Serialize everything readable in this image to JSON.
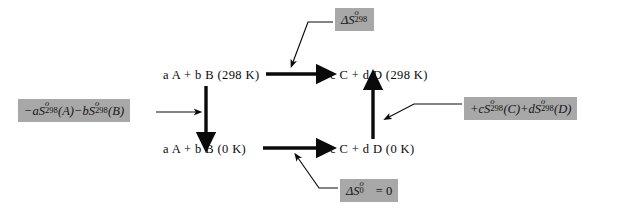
{
  "diagram": {
    "type": "thermodynamic-cycle",
    "background_color": "#ffffff",
    "callout_fill_color": "#a8a8a8",
    "line_color": "#0a0a0a"
  },
  "states": {
    "top_left": {
      "label": "a A + b B (298 K)",
      "temperature": "298 K",
      "side": "reactants"
    },
    "top_right": {
      "label": "c C + d D (298 K)",
      "temperature": "298 K",
      "side": "products"
    },
    "bottom_left": {
      "label": "a A + b B (0  K)",
      "temperature": "0 K",
      "side": "reactants"
    },
    "bottom_right": {
      "label": "c C + d D (0 K)",
      "temperature": "0 K",
      "side": "products"
    }
  },
  "callouts": {
    "top": {
      "name": "delta-S-298",
      "symbol": "ΔS",
      "superscript": "o",
      "subscript": "298",
      "suffix": "",
      "plain_text": "ΔS°298"
    },
    "left": {
      "name": "minus-entropy-reactants",
      "plain_text": "−aS°298 (A) − bS°298 (B)",
      "terms": [
        {
          "sign": "−",
          "coefficient": "a",
          "symbol": "S",
          "superscript": "o",
          "subscript": "298",
          "species": "(A)"
        },
        {
          "sign": "−",
          "coefficient": "b",
          "symbol": "S",
          "superscript": "o",
          "subscript": "298",
          "species": "(B)"
        }
      ]
    },
    "right": {
      "name": "plus-entropy-products",
      "plain_text": "+cS°298 (C) + dS°298 (D)",
      "terms": [
        {
          "sign": "+",
          "coefficient": "c",
          "symbol": "S",
          "superscript": "o",
          "subscript": "298",
          "species": "(C)"
        },
        {
          "sign": "+",
          "coefficient": "d",
          "symbol": "S",
          "superscript": "o",
          "subscript": "298",
          "species": "(D)"
        }
      ]
    },
    "bottom": {
      "name": "delta-S-0-equals-zero",
      "symbol": "ΔS",
      "superscript": "o",
      "subscript": "0",
      "suffix": " = 0",
      "plain_text": "ΔS°0 = 0"
    }
  },
  "arrows": {
    "top_horizontal": {
      "direction": "right",
      "from": "top_left",
      "to": "top_right",
      "labelled_by": "top"
    },
    "bottom_horizontal": {
      "direction": "right",
      "from": "bottom_left",
      "to": "bottom_right",
      "labelled_by": "bottom"
    },
    "left_vertical": {
      "direction": "down",
      "from": "top_left",
      "to": "bottom_left",
      "labelled_by": "left"
    },
    "right_vertical": {
      "direction": "up",
      "from": "bottom_right",
      "to": "top_right",
      "labelled_by": "right"
    }
  }
}
